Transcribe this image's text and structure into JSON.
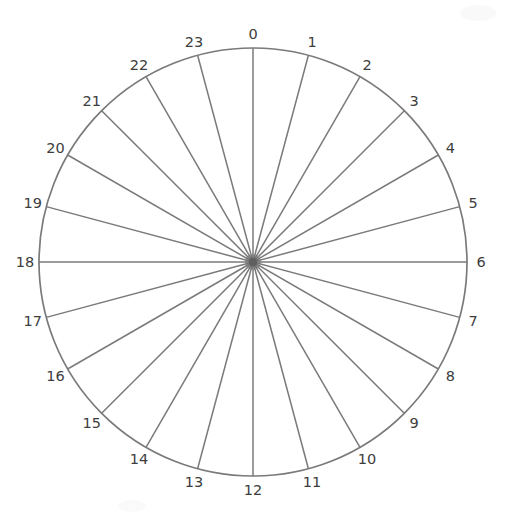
{
  "diagram": {
    "divisions": 24,
    "labels": [
      "0",
      "1",
      "2",
      "3",
      "4",
      "5",
      "6",
      "7",
      "8",
      "9",
      "10",
      "11",
      "12",
      "13",
      "14",
      "15",
      "16",
      "17",
      "18",
      "19",
      "20",
      "21",
      "22",
      "23"
    ],
    "colors": {
      "background": "#ffffff",
      "stroke": "#7a7a7a",
      "label_text": "#3d3d3d",
      "center_dot": "#5f5f5f"
    }
  }
}
